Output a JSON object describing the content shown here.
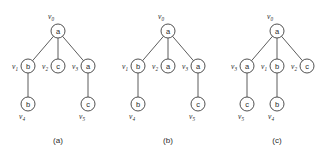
{
  "figure": {
    "background": "#ffffff",
    "stroke_color": "#3d3d3d",
    "text_color": "#2b2b2b",
    "node_radius": 7
  },
  "trees": [
    {
      "id": "tree-a",
      "caption": "(a)",
      "caption_x": 58,
      "caption_y": 143,
      "nodes": [
        {
          "id": "a-v0",
          "letter": "a",
          "vlabel_v": "v",
          "vlabel_sub": "0",
          "x": 58,
          "y": 31,
          "label_x": 51,
          "label_y": 19,
          "label_pos": "above-left"
        },
        {
          "id": "a-v1",
          "letter": "b",
          "vlabel_v": "v",
          "vlabel_sub": "1",
          "x": 28,
          "y": 66,
          "label_x": 15,
          "label_y": 69,
          "label_pos": "left"
        },
        {
          "id": "a-v2",
          "letter": "c",
          "vlabel_v": "v",
          "vlabel_sub": "2",
          "x": 58,
          "y": 66,
          "label_x": 45,
          "label_y": 69,
          "label_pos": "left"
        },
        {
          "id": "a-v3",
          "letter": "a",
          "vlabel_v": "v",
          "vlabel_sub": "3",
          "x": 88,
          "y": 66,
          "label_x": 75,
          "label_y": 69,
          "label_pos": "left"
        },
        {
          "id": "a-v4",
          "letter": "b",
          "vlabel_v": "v",
          "vlabel_sub": "4",
          "x": 28,
          "y": 104,
          "label_x": 22,
          "label_y": 119,
          "label_pos": "below-left"
        },
        {
          "id": "a-v5",
          "letter": "c",
          "vlabel_v": "v",
          "vlabel_sub": "5",
          "x": 88,
          "y": 104,
          "label_x": 82,
          "label_y": 119,
          "label_pos": "below-left"
        }
      ],
      "edges": [
        {
          "from": "a-v0",
          "to": "a-v1"
        },
        {
          "from": "a-v0",
          "to": "a-v2"
        },
        {
          "from": "a-v0",
          "to": "a-v3"
        },
        {
          "from": "a-v1",
          "to": "a-v4"
        },
        {
          "from": "a-v3",
          "to": "a-v5"
        }
      ]
    },
    {
      "id": "tree-b",
      "caption": "(b)",
      "caption_x": 168,
      "caption_y": 143,
      "nodes": [
        {
          "id": "b-v0",
          "letter": "a",
          "vlabel_v": "v",
          "vlabel_sub": "0",
          "x": 168,
          "y": 31,
          "label_x": 161,
          "label_y": 19,
          "label_pos": "above-left"
        },
        {
          "id": "b-v1",
          "letter": "b",
          "vlabel_v": "v",
          "vlabel_sub": "1",
          "x": 138,
          "y": 66,
          "label_x": 125,
          "label_y": 69,
          "label_pos": "left"
        },
        {
          "id": "b-v2",
          "letter": "a",
          "vlabel_v": "v",
          "vlabel_sub": "2",
          "x": 168,
          "y": 66,
          "label_x": 155,
          "label_y": 69,
          "label_pos": "left"
        },
        {
          "id": "b-v3",
          "letter": "a",
          "vlabel_v": "v",
          "vlabel_sub": "3",
          "x": 198,
          "y": 66,
          "label_x": 185,
          "label_y": 69,
          "label_pos": "left"
        },
        {
          "id": "b-v4",
          "letter": "b",
          "vlabel_v": "v",
          "vlabel_sub": "4",
          "x": 138,
          "y": 104,
          "label_x": 132,
          "label_y": 119,
          "label_pos": "below-left"
        },
        {
          "id": "b-v5",
          "letter": "c",
          "vlabel_v": "v",
          "vlabel_sub": "5",
          "x": 198,
          "y": 104,
          "label_x": 192,
          "label_y": 119,
          "label_pos": "below-left"
        }
      ],
      "edges": [
        {
          "from": "b-v0",
          "to": "b-v1"
        },
        {
          "from": "b-v0",
          "to": "b-v2"
        },
        {
          "from": "b-v0",
          "to": "b-v3"
        },
        {
          "from": "b-v1",
          "to": "b-v4"
        },
        {
          "from": "b-v3",
          "to": "b-v5"
        }
      ]
    },
    {
      "id": "tree-c",
      "caption": "(c)",
      "caption_x": 277,
      "caption_y": 143,
      "nodes": [
        {
          "id": "c-v0",
          "letter": "a",
          "vlabel_v": "v",
          "vlabel_sub": "0",
          "x": 277,
          "y": 31,
          "label_x": 270,
          "label_y": 19,
          "label_pos": "above-left"
        },
        {
          "id": "c-v3",
          "letter": "a",
          "vlabel_v": "v",
          "vlabel_sub": "3",
          "x": 247,
          "y": 66,
          "label_x": 234,
          "label_y": 69,
          "label_pos": "left"
        },
        {
          "id": "c-v1",
          "letter": "b",
          "vlabel_v": "v",
          "vlabel_sub": "1",
          "x": 277,
          "y": 66,
          "label_x": 264,
          "label_y": 69,
          "label_pos": "left"
        },
        {
          "id": "c-v2",
          "letter": "c",
          "vlabel_v": "v",
          "vlabel_sub": "2",
          "x": 307,
          "y": 66,
          "label_x": 294,
          "label_y": 69,
          "label_pos": "left"
        },
        {
          "id": "c-v5",
          "letter": "c",
          "vlabel_v": "v",
          "vlabel_sub": "5",
          "x": 247,
          "y": 104,
          "label_x": 241,
          "label_y": 119,
          "label_pos": "below-left"
        },
        {
          "id": "c-v4",
          "letter": "b",
          "vlabel_v": "v",
          "vlabel_sub": "4",
          "x": 277,
          "y": 104,
          "label_x": 271,
          "label_y": 119,
          "label_pos": "below-left"
        }
      ],
      "edges": [
        {
          "from": "c-v0",
          "to": "c-v3"
        },
        {
          "from": "c-v0",
          "to": "c-v1"
        },
        {
          "from": "c-v0",
          "to": "c-v2"
        },
        {
          "from": "c-v3",
          "to": "c-v5"
        },
        {
          "from": "c-v1",
          "to": "c-v4"
        }
      ]
    }
  ]
}
